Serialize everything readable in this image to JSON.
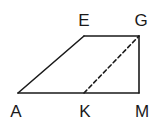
{
  "diagram": {
    "type": "geometry-figure",
    "shape": "trapezoid",
    "stroke_color": "#1a1a1a",
    "points": {
      "A": {
        "label": "A",
        "x": 18,
        "y": 93,
        "label_x": 16,
        "label_y": 117
      },
      "E": {
        "label": "E",
        "x": 84,
        "y": 36,
        "label_x": 84,
        "label_y": 26
      },
      "G": {
        "label": "G",
        "x": 139,
        "y": 36,
        "label_x": 141,
        "label_y": 26
      },
      "M": {
        "label": "M",
        "x": 139,
        "y": 93,
        "label_x": 142,
        "label_y": 117
      },
      "K": {
        "label": "K",
        "x": 84,
        "y": 93,
        "label_x": 85,
        "label_y": 117
      }
    },
    "segments": [
      {
        "from": "A",
        "to": "E",
        "style": "solid"
      },
      {
        "from": "E",
        "to": "G",
        "style": "solid"
      },
      {
        "from": "G",
        "to": "M",
        "style": "solid"
      },
      {
        "from": "M",
        "to": "A",
        "style": "solid"
      },
      {
        "from": "K",
        "to": "G",
        "style": "dashed"
      }
    ]
  }
}
